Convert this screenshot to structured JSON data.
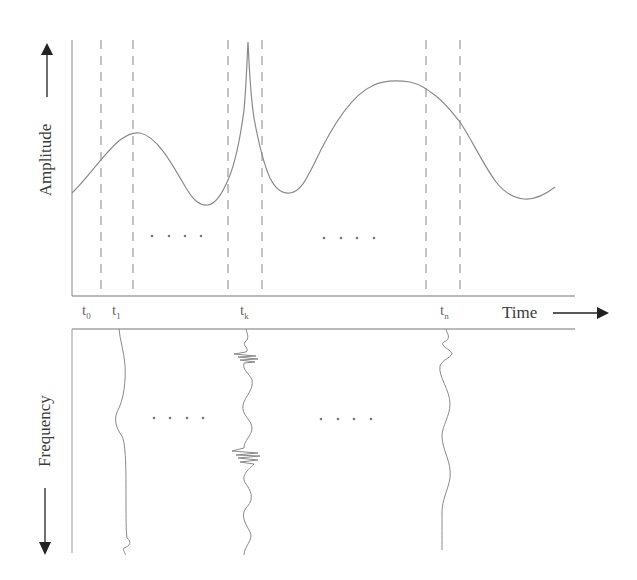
{
  "diagram": {
    "top_panel": {
      "y_axis_label": "Amplitude",
      "y_axis_arrow": "up",
      "signal": "amplitude-vs-time waveform with sharp spike near t_k",
      "ellipsis_left": "· · · ·",
      "ellipsis_right": "· · · ·"
    },
    "time_axis": {
      "label": "Time",
      "arrow": "right",
      "markers": [
        {
          "base": "t",
          "sub": "0"
        },
        {
          "base": "t",
          "sub": "1"
        },
        {
          "base": "t",
          "sub": "k"
        },
        {
          "base": "t",
          "sub": "n"
        }
      ]
    },
    "bottom_panel": {
      "y_axis_label": "Frequency",
      "y_axis_arrow": "down",
      "traces": [
        "spectrum at t_1",
        "spectrum at t_k",
        "spectrum at t_n"
      ],
      "ellipsis_left": "· · · ·",
      "ellipsis_right": "· · · ·"
    },
    "colors": {
      "line": "#888888",
      "axis": "#777777",
      "arrow": "#222222",
      "text": "#3a3a3a"
    }
  }
}
